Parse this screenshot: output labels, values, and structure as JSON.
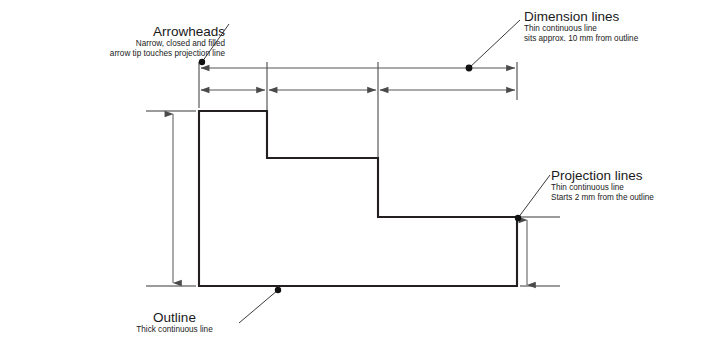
{
  "figure": {
    "background_color": "#ffffff",
    "outline_color": "#231f20",
    "thin_line_color": "#9b9b9b",
    "dimension_line_color": "#555555",
    "text_color": "#1a1a1a"
  },
  "annotations": {
    "arrowheads": {
      "title": "Arrowheads",
      "line1": "Narrow, closed and filled",
      "line2": "arrow tip touches projection line"
    },
    "dimension_lines": {
      "title": "Dimension lines",
      "line1": "Thin continuous line",
      "line2": "sits approx. 10 mm from outline"
    },
    "projection_lines": {
      "title": "Projection lines",
      "line1": "Thin continuous line",
      "line2": "Starts 2 mm from the outline"
    },
    "outline": {
      "title": "Outline",
      "line1": "Thick continuous line"
    }
  },
  "geometry": {
    "outline_path": "M 199 111 L 267 111 L 267 158 L 378 158 L 378 217 L 517 217 L 517 286 L 199 286 Z",
    "projection_lines_vertical": [
      {
        "x": 199,
        "y1": 62,
        "y2": 108
      },
      {
        "x": 267,
        "y1": 62,
        "y2": 154
      },
      {
        "x": 378,
        "y1": 62,
        "y2": 213
      },
      {
        "x": 517,
        "y1": 62,
        "y2": 100
      }
    ],
    "projection_lines_horizontal": [
      {
        "y": 111,
        "x1": 146,
        "x2": 196
      },
      {
        "y": 286,
        "x1": 146,
        "x2": 196
      },
      {
        "y": 217,
        "x1": 520,
        "x2": 560
      },
      {
        "y": 286,
        "x1": 520,
        "x2": 560
      }
    ],
    "dimension_lines_horizontal": [
      {
        "y": 68,
        "x1": 199,
        "x2": 517,
        "label": "overall-width"
      },
      {
        "y": 90,
        "x1": 199,
        "x2": 267,
        "label": "segment-1"
      },
      {
        "y": 90,
        "x1": 267,
        "x2": 378,
        "label": "segment-2"
      },
      {
        "y": 90,
        "x1": 378,
        "x2": 517,
        "label": "segment-3"
      }
    ],
    "dimension_lines_vertical": [
      {
        "x": 173,
        "y1": 112,
        "y2": 285,
        "label": "overall-height"
      },
      {
        "x": 527,
        "y1": 218,
        "y2": 287,
        "label": "base-height"
      }
    ],
    "leader_dots": [
      {
        "name": "arrowheads-dot",
        "x": 202,
        "y": 62
      },
      {
        "name": "dimension-lines-dot",
        "x": 469,
        "y": 68
      },
      {
        "name": "projection-lines-dot",
        "x": 518,
        "y": 218
      },
      {
        "name": "outline-dot",
        "x": 278,
        "y": 290
      }
    ],
    "leader_lines": [
      {
        "name": "arrowheads-leader",
        "x1": 202,
        "y1": 62,
        "x2": 228,
        "y2": 25
      },
      {
        "name": "dimension-lines-leader",
        "x1": 469,
        "y1": 68,
        "x2": 519,
        "y2": 21
      },
      {
        "name": "projection-lines-leader",
        "x1": 518,
        "y1": 218,
        "x2": 549,
        "y2": 176
      },
      {
        "name": "outline-leader",
        "x1": 278,
        "y1": 290,
        "x2": 240,
        "y2": 322
      }
    ]
  }
}
